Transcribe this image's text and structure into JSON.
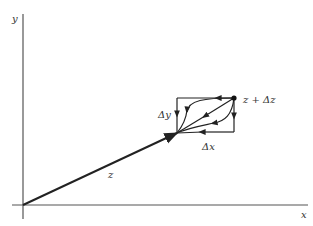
{
  "diagram": {
    "type": "complex-plane-increment",
    "axes": {
      "x_label": "x",
      "y_label": "y"
    },
    "vectors": {
      "z_label": "z"
    },
    "points": {
      "z_plus_dz_label": "z + Δz"
    },
    "increments": {
      "dx_label": "Δx",
      "dy_label": "Δy"
    },
    "colors": {
      "line": "#222222",
      "axis": "#555555"
    }
  }
}
